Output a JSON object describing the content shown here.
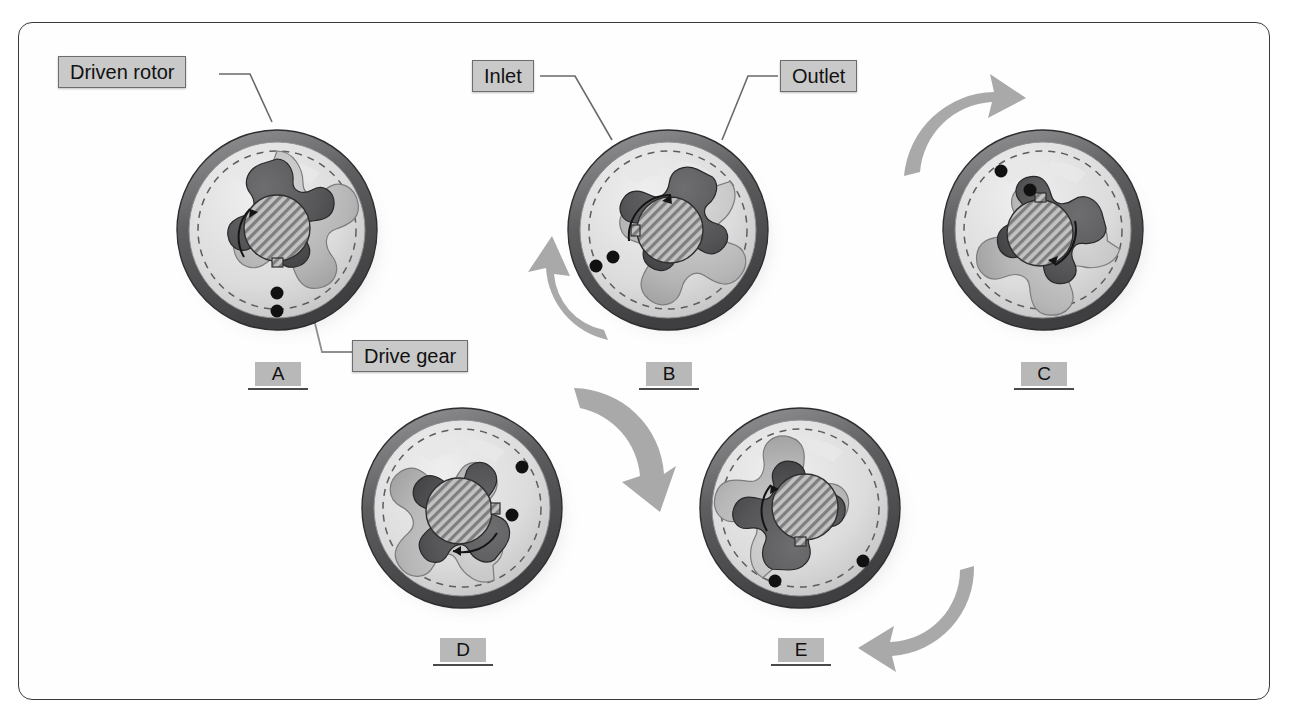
{
  "figure": {
    "title": "Gerotor pump operation sequence",
    "background_color": "#ffffff",
    "frame_color": "#3a3a3c"
  },
  "callouts": [
    {
      "id": "driven-rotor",
      "label": "Driven rotor",
      "x": 58,
      "y": 56,
      "points_to": "A"
    },
    {
      "id": "inlet",
      "label": "Inlet",
      "x": 472,
      "y": 60,
      "points_to": "B"
    },
    {
      "id": "outlet",
      "label": "Outlet",
      "x": 780,
      "y": 60,
      "points_to": "B"
    },
    {
      "id": "drive-gear",
      "label": "Drive gear",
      "x": 352,
      "y": 340,
      "points_to": "A"
    }
  ],
  "panels": [
    {
      "id": "A",
      "label": "A",
      "cx": 277,
      "cy": 230,
      "tag_x": 255,
      "tag_y": 362,
      "rotor_angle": 0,
      "arrow": "none",
      "inner_arrow_angle": 118,
      "dots": [
        {
          "a": 268,
          "r": 0.7
        },
        {
          "a": 268,
          "r": 0.86
        }
      ]
    },
    {
      "id": "B",
      "label": "B",
      "cx": 668,
      "cy": 230,
      "tag_x": 646,
      "tag_y": 362,
      "rotor_angle": 52,
      "arrow": "left",
      "inner_arrow_angle": 150,
      "dots": [
        {
          "a": 196,
          "r": 0.7
        },
        {
          "a": 188,
          "r": 0.86
        }
      ]
    },
    {
      "id": "C",
      "label": "C",
      "cx": 1043,
      "cy": 230,
      "tag_x": 1021,
      "tag_y": 362,
      "rotor_angle": 104,
      "arrow": "top",
      "inner_arrow_angle": 20,
      "dots": [
        {
          "a": 120,
          "r": 0.7
        },
        {
          "a": 98,
          "r": 0.86
        }
      ]
    },
    {
      "id": "D",
      "label": "D",
      "cx": 462,
      "cy": 508,
      "tag_x": 440,
      "tag_y": 638,
      "rotor_angle": 156,
      "arrow": "topright",
      "inner_arrow_angle": 258,
      "dots": [
        {
          "a": 20,
          "r": 0.7
        },
        {
          "a": 28,
          "r": 0.86
        }
      ]
    },
    {
      "id": "E",
      "label": "E",
      "cx": 800,
      "cy": 508,
      "tag_x": 778,
      "tag_y": 638,
      "rotor_angle": 208,
      "arrow": "bottomright",
      "inner_arrow_angle": 160,
      "dots": [
        {
          "a": 290,
          "r": 0.7
        },
        {
          "a": 330,
          "r": 0.86
        }
      ]
    }
  ],
  "geometry": {
    "housing_outer_ring_color": "#6f7072",
    "housing_inner_face_color": "#d8d8d8",
    "driven_rotor_color": "#bdbdbd",
    "drive_gear_color": "#5a5a5c",
    "shaft_bore_hatch_color": "#9a9a9a",
    "index_dot_color": "#111111",
    "dashed_circle_color": "#5d5d5f",
    "rotation_arrow_color": "#a9a9a9",
    "driven_rotor_lobes": 7,
    "drive_gear_lobes": 6
  }
}
